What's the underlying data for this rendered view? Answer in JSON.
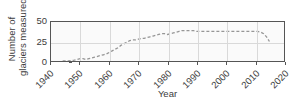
{
  "chart_data": {
    "type": "line",
    "title": "",
    "xlabel": "Year",
    "ylabel_line1": "Number of",
    "ylabel_line2": "glaciers measured",
    "ylabel": "Number of glaciers measured",
    "xlim": [
      1940,
      2020
    ],
    "ylim": [
      0,
      50
    ],
    "xticks": [
      1940,
      1950,
      1960,
      1970,
      1980,
      1990,
      2000,
      2010,
      2020
    ],
    "xticklabels": [
      "1940",
      "1950",
      "1960",
      "1970",
      "1980",
      "1990",
      "2000",
      "2010",
      "2020"
    ],
    "yticks": [
      0,
      25,
      50
    ],
    "yticklabels": [
      "0",
      "25",
      "50"
    ],
    "grid": true,
    "grid_color": "#d9d9d9",
    "legend": "none",
    "line_style": "dashed",
    "line_color": "#969696",
    "plot_bg_color": "#fafafa",
    "frame_color": "#555555",
    "text_color": "#3c3c3c",
    "series": [
      {
        "name": "Number of glaciers measured",
        "x": [
          1944,
          1946,
          1948,
          1949,
          1950,
          1951,
          1952,
          1953,
          1954,
          1955,
          1956,
          1957,
          1958,
          1959,
          1960,
          1961,
          1962,
          1963,
          1964,
          1965,
          1966,
          1967,
          1968,
          1969,
          1970,
          1971,
          1972,
          1973,
          1974,
          1975,
          1976,
          1977,
          1978,
          1979,
          1980,
          1981,
          1982,
          1983,
          1984,
          1985,
          1986,
          1987,
          1988,
          1989,
          1990,
          1991,
          1992,
          1993,
          1994,
          1995,
          1996,
          1997,
          1998,
          1999,
          2000,
          2001,
          2002,
          2003,
          2004,
          2005,
          2006,
          2007,
          2008,
          2009,
          2010,
          2011,
          2012,
          2013,
          2014,
          2015
        ],
        "y": [
          0,
          0,
          1,
          2,
          3,
          3,
          2,
          3,
          4,
          5,
          6,
          7,
          8,
          9,
          11,
          13,
          15,
          17,
          20,
          22,
          24,
          26,
          27,
          27,
          28,
          29,
          29,
          30,
          31,
          32,
          33,
          34,
          35,
          35,
          34,
          35,
          36,
          37,
          38,
          39,
          39,
          39,
          39,
          39,
          38,
          38,
          38,
          38,
          38,
          38,
          38,
          38,
          38,
          38,
          38,
          38,
          38,
          38,
          38,
          38,
          38,
          38,
          38,
          38,
          38,
          38,
          37,
          35,
          31,
          25
        ]
      }
    ]
  }
}
